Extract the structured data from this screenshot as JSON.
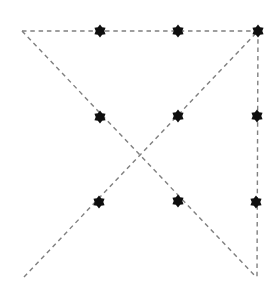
{
  "diagram": {
    "width": 280,
    "height": 293,
    "background_color": "#ffffff",
    "style": {
      "dot_color": "#0e0e0e",
      "line_color": "#7f7f7f",
      "line_width": 1.4,
      "dash_on": 4.5,
      "dash_off": 3.8,
      "marker_shape": "six-pointed-star",
      "marker_outer_radius": 6.4,
      "marker_inner_radius": 4.3,
      "marker_points": 6,
      "marker_rotation_deg": -90
    },
    "dots": [
      {
        "id": "top-left",
        "x": 100,
        "y": 31
      },
      {
        "id": "top-center",
        "x": 178,
        "y": 31
      },
      {
        "id": "top-right",
        "x": 258,
        "y": 31
      },
      {
        "id": "middle-left",
        "x": 100,
        "y": 117
      },
      {
        "id": "middle-center",
        "x": 178,
        "y": 116
      },
      {
        "id": "middle-right",
        "x": 257,
        "y": 116
      },
      {
        "id": "bottom-left",
        "x": 99,
        "y": 202
      },
      {
        "id": "bottom-center",
        "x": 178,
        "y": 201
      },
      {
        "id": "bottom-right",
        "x": 256,
        "y": 202
      }
    ],
    "lines": [
      {
        "id": "top-horizontal",
        "x1": 22,
        "y1": 31,
        "x2": 258,
        "y2": 31
      },
      {
        "id": "right-vertical",
        "x1": 258,
        "y1": 31,
        "x2": 257,
        "y2": 277
      },
      {
        "id": "diagonal-tl-br",
        "x1": 22,
        "y1": 31,
        "x2": 256,
        "y2": 277
      },
      {
        "id": "diagonal-bl-tr",
        "x1": 24,
        "y1": 277,
        "x2": 258,
        "y2": 31
      }
    ]
  }
}
